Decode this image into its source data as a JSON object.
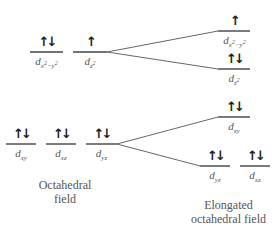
{
  "diagram": {
    "type": "crystal-field-splitting",
    "octahedral": {
      "caption_line1": "Octahedral",
      "caption_line2": "field",
      "eg": [
        {
          "orbital": "dx2-y2",
          "sub": "x",
          "sup1": "2",
          "mid": "−y",
          "sup2": "2",
          "electrons": "↑↓"
        },
        {
          "orbital": "dz2",
          "sub": "z",
          "sup": "2",
          "electrons": "↑"
        }
      ],
      "t2g": [
        {
          "orbital": "dxy",
          "sub": "xy",
          "electrons": "↑↓"
        },
        {
          "orbital": "dxz",
          "sub": "xz",
          "electrons": "↑↓"
        },
        {
          "orbital": "dyz",
          "sub": "yz",
          "electrons": "↑↓"
        }
      ]
    },
    "elongated": {
      "caption_line1": "Elongated",
      "caption_line2": "octahedral field",
      "upper": [
        {
          "orbital": "dx2-y2",
          "electrons": "↑"
        },
        {
          "orbital": "dz2",
          "electrons": "↑↓"
        }
      ],
      "lower": [
        {
          "orbital": "dxy",
          "electrons": "↑↓"
        },
        {
          "orbital": "dyz",
          "electrons": "↑↓"
        },
        {
          "orbital": "dxz",
          "electrons": "↑↓"
        }
      ]
    },
    "d": "d"
  }
}
